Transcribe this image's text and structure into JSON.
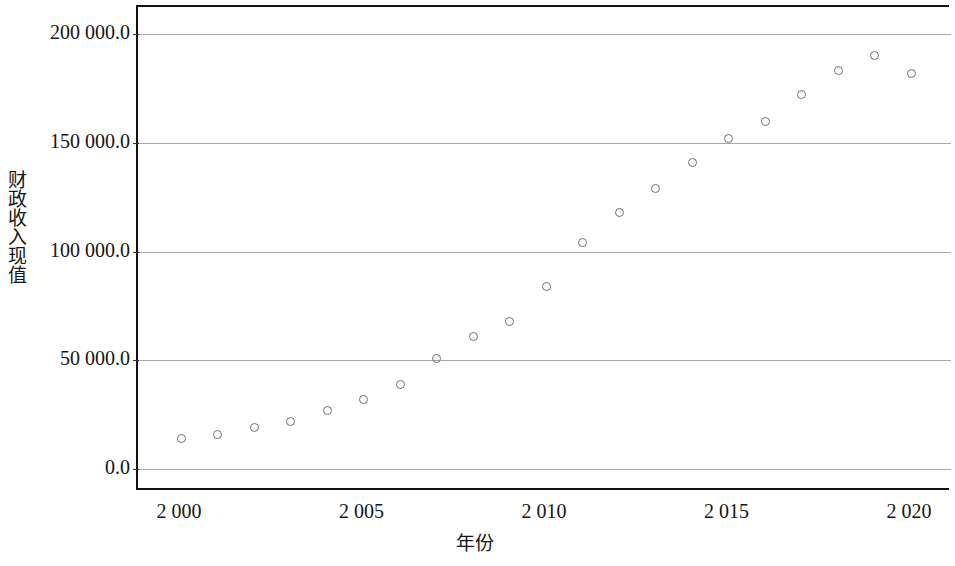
{
  "chart_data": {
    "type": "scatter",
    "title": "",
    "xlabel": "年份",
    "ylabel": "财政收入现值",
    "xlim": [
      1999,
      2021
    ],
    "ylim": [
      -5000,
      205000
    ],
    "grid": true,
    "legend": "none",
    "marker": "open-circle",
    "marker_color": "#6e6e76",
    "x_tick_labels": [
      "2 000",
      "2 005",
      "2 010",
      "2 015",
      "2 020"
    ],
    "x_tick_values": [
      2000,
      2005,
      2010,
      2015,
      2020
    ],
    "y_tick_labels": [
      "0.0",
      "50 000.0",
      "100 000.0",
      "150 000.0",
      "200 000.0"
    ],
    "y_tick_values": [
      0,
      50000,
      100000,
      150000,
      200000
    ],
    "x": [
      2000,
      2001,
      2002,
      2003,
      2004,
      2005,
      2006,
      2007,
      2008,
      2009,
      2010,
      2011,
      2012,
      2013,
      2014,
      2015,
      2016,
      2017,
      2018,
      2019,
      2020
    ],
    "values": [
      14000,
      16000,
      19000,
      22000,
      27000,
      32000,
      39000,
      51000,
      61000,
      68000,
      84000,
      104000,
      118000,
      129000,
      141000,
      152000,
      160000,
      172000,
      183000,
      190000,
      182000
    ],
    "series": [
      {
        "name": "财政收入现值",
        "values": [
          14000,
          16000,
          19000,
          22000,
          27000,
          32000,
          39000,
          51000,
          61000,
          68000,
          84000,
          104000,
          118000,
          129000,
          141000,
          152000,
          160000,
          172000,
          183000,
          190000,
          182000
        ]
      }
    ]
  },
  "axes": {
    "y_title": "财政收入现值",
    "x_title": "年份"
  }
}
